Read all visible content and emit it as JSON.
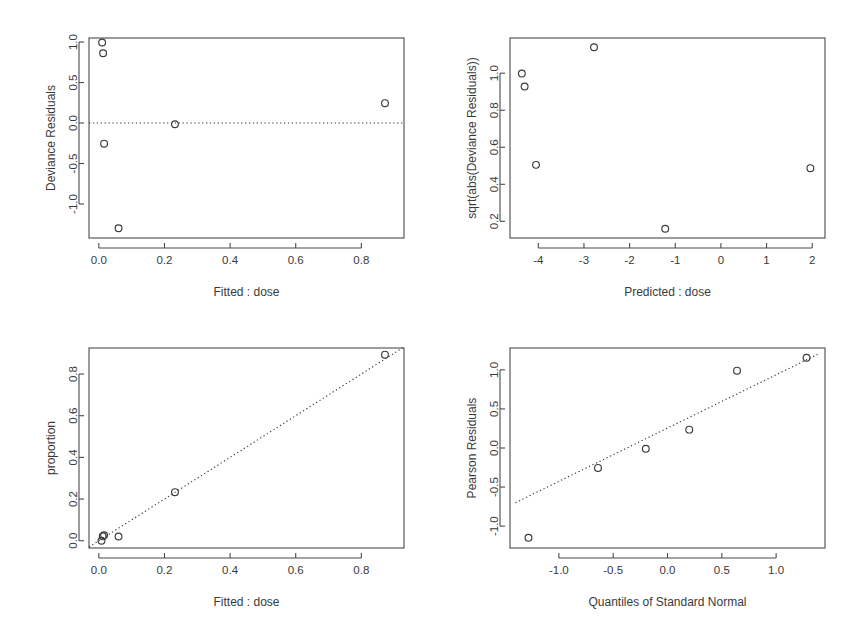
{
  "figure": {
    "title": "",
    "layout": "2x2 panel grid",
    "background_color": "#ffffff",
    "foreground_color": "#3a3a3a"
  },
  "chart_data": [
    {
      "id": "residuals-vs-fitted",
      "position": "top-left",
      "type": "scatter",
      "title": "",
      "xlabel": "Fitted : dose",
      "ylabel": "Deviance Residuals",
      "xlim": [
        -0.03,
        0.93
      ],
      "ylim": [
        -1.42,
        1.05
      ],
      "xticks": [
        "0.0",
        "0.2",
        "0.4",
        "0.6",
        "0.8"
      ],
      "xtick_values": [
        0.0,
        0.2,
        0.4,
        0.6,
        0.8
      ],
      "yticks": [
        "1.0",
        "0.5",
        "0.0",
        "-0.5",
        "-1.0"
      ],
      "ytick_values": [
        1.0,
        0.5,
        0.0,
        -0.5,
        -1.0
      ],
      "grid": false,
      "legend": "none",
      "x": [
        0.01,
        0.013,
        0.016,
        0.06,
        0.232,
        0.872
      ],
      "y": [
        0.995,
        0.862,
        -0.255,
        -1.3,
        -0.015,
        0.245
      ],
      "annotations": [
        {
          "kind": "reference-line",
          "orientation": "horizontal",
          "value": 0.0,
          "style": "dotted"
        }
      ]
    },
    {
      "id": "scale-location",
      "position": "top-right",
      "type": "scatter",
      "title": "",
      "xlabel": "Predicted : dose",
      "ylabel": "sqrt(abs(Deviance Residuals))",
      "xlim": [
        -4.62,
        2.28
      ],
      "ylim": [
        0.11,
        1.19
      ],
      "xticks": [
        "-4",
        "-3",
        "-2",
        "-1",
        "0",
        "1",
        "2"
      ],
      "xtick_values": [
        -4,
        -3,
        -2,
        -1,
        0,
        1,
        2
      ],
      "yticks": [
        "0.2",
        "0.4",
        "0.6",
        "0.8",
        "1.0"
      ],
      "ytick_values": [
        0.2,
        0.4,
        0.6,
        0.8,
        1.0
      ],
      "grid": false,
      "legend": "none",
      "x": [
        -4.36,
        -4.3,
        -4.05,
        -2.78,
        -1.22,
        1.96
      ],
      "y": [
        0.998,
        0.928,
        0.505,
        1.14,
        0.16,
        0.487
      ],
      "annotations": []
    },
    {
      "id": "observed-vs-fitted",
      "position": "bottom-left",
      "type": "scatter",
      "title": "",
      "xlabel": "Fitted : dose",
      "ylabel": "proportion",
      "xlim": [
        -0.03,
        0.93
      ],
      "ylim": [
        -0.035,
        0.925
      ],
      "xticks": [
        "0.0",
        "0.2",
        "0.4",
        "0.6",
        "0.8"
      ],
      "xtick_values": [
        0.0,
        0.2,
        0.4,
        0.6,
        0.8
      ],
      "yticks": [
        "0.0",
        "0.2",
        "0.4",
        "0.6",
        "0.8"
      ],
      "ytick_values": [
        0.0,
        0.2,
        0.4,
        0.6,
        0.8
      ],
      "grid": false,
      "legend": "none",
      "x": [
        0.008,
        0.012,
        0.016,
        0.06,
        0.232,
        0.872
      ],
      "y": [
        0.0,
        0.021,
        0.026,
        0.02,
        0.233,
        0.893
      ],
      "annotations": [
        {
          "kind": "reference-line",
          "orientation": "diagonal",
          "from": [
            -0.03,
            -0.03
          ],
          "to": [
            0.93,
            0.93
          ],
          "style": "dotted"
        }
      ]
    },
    {
      "id": "normal-qq",
      "position": "bottom-right",
      "type": "scatter",
      "title": "",
      "xlabel": "Quantiles of Standard Normal",
      "ylabel": "Pearson Residuals",
      "xlim": [
        -1.45,
        1.45
      ],
      "ylim": [
        -1.28,
        1.28
      ],
      "xticks": [
        "-1.0",
        "-0.5",
        "0.0",
        "0.5",
        "1.0"
      ],
      "xtick_values": [
        -1.0,
        -0.5,
        0.0,
        0.5,
        1.0
      ],
      "yticks": [
        "-1.0",
        "-0.5",
        "0.0",
        "0.5",
        "1.0"
      ],
      "ytick_values": [
        -1.0,
        -0.5,
        0.0,
        0.5,
        1.0
      ],
      "grid": false,
      "legend": "none",
      "x": [
        -1.28,
        -0.64,
        -0.2,
        0.2,
        0.64,
        1.28
      ],
      "y": [
        -1.15,
        -0.255,
        -0.01,
        0.235,
        0.99,
        1.155
      ],
      "annotations": [
        {
          "kind": "reference-line",
          "orientation": "qq-line",
          "from": [
            -1.4,
            -0.7
          ],
          "to": [
            1.4,
            1.21
          ],
          "style": "dotted"
        }
      ]
    }
  ]
}
